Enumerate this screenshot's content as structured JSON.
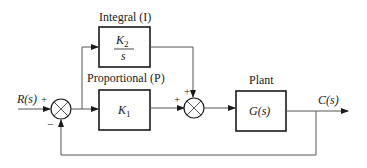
{
  "diagram": {
    "type": "block-diagram",
    "input": {
      "label": "R(s)"
    },
    "output": {
      "label": "C(s)"
    },
    "blocks": [
      {
        "id": "integral",
        "caption": "Integral (I)",
        "numerator": "K",
        "numerator_sub": "2",
        "denominator": "s"
      },
      {
        "id": "proportional",
        "caption": "Proportional (P)",
        "content": "K",
        "content_sub": "1"
      },
      {
        "id": "plant",
        "caption": "Plant",
        "content": "G(s)"
      }
    ],
    "junctions": [
      {
        "id": "error-sum",
        "signs": {
          "left": "+",
          "bottom": "−"
        }
      },
      {
        "id": "controller-sum",
        "signs": {
          "left": "+",
          "top": "+"
        }
      }
    ],
    "colors": {
      "line": "#555555",
      "block": "#1a1a1a",
      "background": "#ffffff"
    }
  }
}
